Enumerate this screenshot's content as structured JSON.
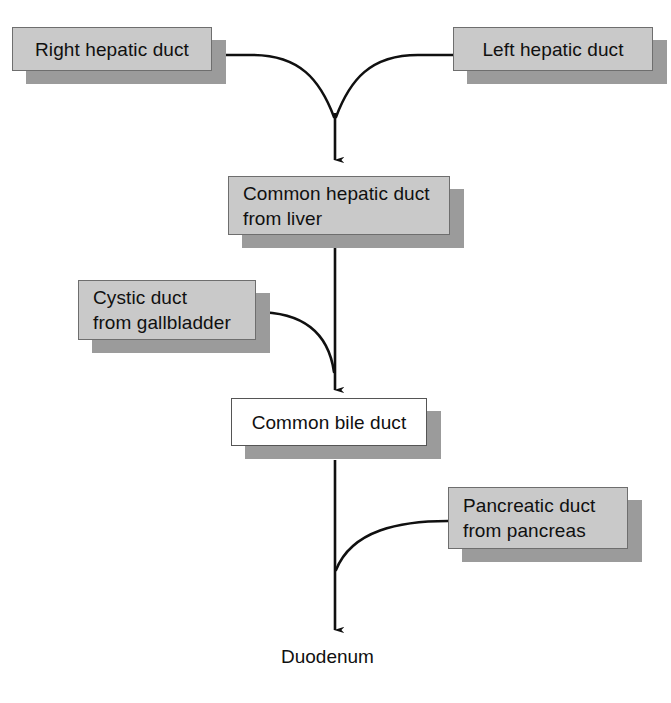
{
  "diagram": {
    "type": "flow-diagram",
    "colors": {
      "box_fill": "#c9c9c9",
      "box_fill_alt": "#ffffff",
      "box_border": "#6e6e6e",
      "box_shadow": "#9b9b9b",
      "connector": "#101010",
      "text": "#101010",
      "background": "#ffffff"
    },
    "nodes": [
      {
        "id": "right-hepatic-duct",
        "label": "Right hepatic duct",
        "style": "gray",
        "align": "center",
        "x": 12,
        "y": 27,
        "w": 200,
        "h": 44
      },
      {
        "id": "left-hepatic-duct",
        "label": "Left hepatic duct",
        "style": "gray",
        "align": "center",
        "x": 453,
        "y": 27,
        "w": 200,
        "h": 44
      },
      {
        "id": "common-hepatic-duct",
        "label": "Common hepatic duct\nfrom liver",
        "style": "gray",
        "align": "left",
        "x": 228,
        "y": 176,
        "w": 222,
        "h": 59
      },
      {
        "id": "cystic-duct",
        "label": "Cystic duct\nfrom gallbladder",
        "style": "gray",
        "align": "left",
        "x": 78,
        "y": 280,
        "w": 178,
        "h": 60
      },
      {
        "id": "common-bile-duct",
        "label": "Common bile duct",
        "style": "white",
        "align": "center",
        "x": 231,
        "y": 398,
        "w": 196,
        "h": 48
      },
      {
        "id": "pancreatic-duct",
        "label": "Pancreatic duct\nfrom pancreas",
        "style": "gray",
        "align": "left",
        "x": 448,
        "y": 487,
        "w": 180,
        "h": 62
      }
    ],
    "plain_labels": [
      {
        "id": "duodenum",
        "label": "Duodenum",
        "x": 281,
        "y": 645
      }
    ],
    "connectors": [
      {
        "id": "right-hepatic-to-junction",
        "from": "right-hepatic-duct",
        "to": "junction",
        "shape": "curve"
      },
      {
        "id": "left-hepatic-to-junction",
        "from": "left-hepatic-duct",
        "to": "junction",
        "shape": "curve"
      },
      {
        "id": "junction-to-common-hepatic",
        "from": "junction",
        "to": "common-hepatic-duct",
        "shape": "arrow-down"
      },
      {
        "id": "common-hepatic-to-common-bile",
        "from": "common-hepatic-duct",
        "to": "common-bile-duct",
        "shape": "arrow-down"
      },
      {
        "id": "cystic-to-common-bile",
        "from": "cystic-duct",
        "to": "common-bile-duct",
        "shape": "curve"
      },
      {
        "id": "common-bile-to-duodenum",
        "from": "common-bile-duct",
        "to": "duodenum",
        "shape": "arrow-down"
      },
      {
        "id": "pancreatic-to-common-bile",
        "from": "pancreatic-duct",
        "to": "common-bile-duct",
        "shape": "curve"
      }
    ]
  }
}
